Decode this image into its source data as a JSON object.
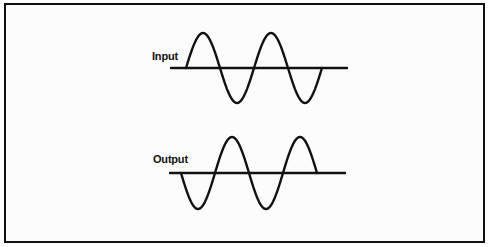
{
  "diagram": {
    "input": {
      "label": "Input",
      "baseline_y": 68,
      "axis_x": [
        171,
        347
      ],
      "wave_start_x": 186,
      "wave_end_x": 322,
      "amplitude": 35,
      "half_period": 34,
      "phase": "starts rising (positive half-cycle first)",
      "cycles": 2
    },
    "output": {
      "label": "Output",
      "baseline_y": 173,
      "axis_x": [
        170,
        345
      ],
      "wave_start_x": 181,
      "wave_end_x": 317,
      "amplitude": 36,
      "half_period": 34,
      "phase": "starts falling (inverted, 180° phase shift)",
      "cycles": 2
    },
    "colors": {
      "stroke": "#111111",
      "background": "#fcfcfc"
    }
  }
}
